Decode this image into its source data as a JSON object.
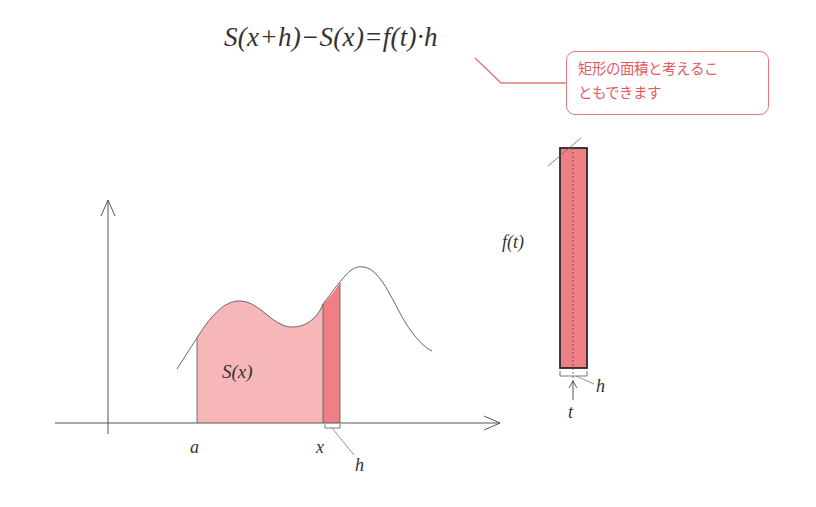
{
  "formula": {
    "text": "S(x+h)−S(x)=f(t)·h"
  },
  "callout": {
    "line1": "矩形の面積と考えるこ",
    "line2": "ともできます",
    "color": "#e35a63"
  },
  "graph": {
    "area_label": "S(x)",
    "x_label_a": "a",
    "x_label_x": "x",
    "h_label": "h",
    "area_fill": "#f7b7b9",
    "strip_fill": "#ef7f84"
  },
  "rectangle": {
    "height_label": "f(t)",
    "width_label": "h",
    "point_label": "t",
    "fill": "#ef7f84"
  }
}
